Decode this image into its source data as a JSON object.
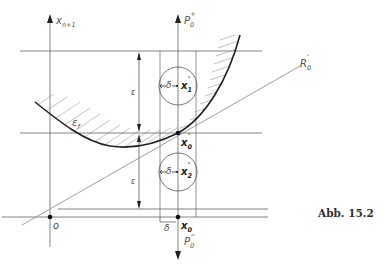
{
  "figure": {
    "caption": "Abb. 15.2",
    "labels": {
      "axis_x": "x",
      "axis_x_sub": "n+1",
      "p_plus": "P",
      "p_plus_sub": "0",
      "p_plus_sup": "+",
      "p_minus": "P",
      "p_minus_sub": "0",
      "p_minus_sup": "−",
      "r_line": "R",
      "r_line_sub": "0",
      "r_line_sup": "'",
      "epsilon_upper": "ε",
      "epsilon_lower": "ε",
      "epsilon_f": "ε",
      "epsilon_f_sub": "f",
      "delta_1": "δ",
      "delta_2": "δ",
      "delta_bottom": "δ",
      "x1": "x",
      "x1_sub": "1",
      "x1_sup": "'",
      "x2": "x",
      "x2_sub": "2",
      "x2_sup": "'",
      "x0_prime": "x",
      "x0_prime_sub": "0",
      "x0_prime_sup": "'",
      "x0": "x",
      "x0_sub": "0",
      "origin": "o"
    },
    "colors": {
      "line": "#666666",
      "curve": "#222222",
      "text": "#555555"
    }
  }
}
